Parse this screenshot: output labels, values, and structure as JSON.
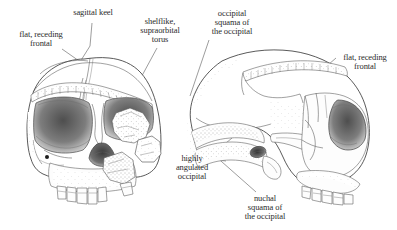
{
  "figure": {
    "background_color": "#ffffff",
    "ink_color": "#3c3c3c",
    "leader_color": "#5a5a5a",
    "views": [
      {
        "id": "frontal-skull",
        "name": "frontal view skull",
        "description": "Anterior (front) view of a Homo erectus cranium showing orbits, nasal aperture, supraorbital torus and maxillary teeth"
      },
      {
        "id": "lateral-skull",
        "name": "lateral view skull",
        "description": "Right lateral (profile) view of a Homo erectus cranium facing right, showing occipital region, supraorbital torus and facial skeleton"
      }
    ]
  },
  "labels": [
    {
      "id": "flat-receding-frontal-left",
      "text": "flat, receding\nfrontal",
      "lines": [
        "flat, receding",
        "frontal"
      ],
      "target_view": "frontal-skull"
    },
    {
      "id": "sagittal-keel",
      "text": "sagittal keel",
      "lines": [
        "sagittal keel"
      ],
      "target_view": "frontal-skull"
    },
    {
      "id": "shelflike-supraorbital-torus",
      "text": "shelflike,\nsupraorbital\ntorus",
      "lines": [
        "shelflike,",
        "supraorbital",
        "torus"
      ],
      "target_view": "frontal-skull"
    },
    {
      "id": "occipital-squama",
      "text": "occipital\nsquama of\nthe occipital",
      "lines": [
        "occipital",
        "squama of",
        "the occipital"
      ],
      "target_view": "lateral-skull"
    },
    {
      "id": "flat-receding-frontal-right",
      "text": "flat, receding\nfrontal",
      "lines": [
        "flat, receding",
        "frontal"
      ],
      "target_view": "lateral-skull"
    },
    {
      "id": "highly-angulated-occipital",
      "text": "highly\nangulated\noccipital",
      "lines": [
        "highly",
        "angulated",
        "occipital"
      ],
      "target_view": "lateral-skull"
    },
    {
      "id": "nuchal-squama",
      "text": "nuchal\nsquama of\nthe occipital",
      "lines": [
        "nuchal",
        "squama of",
        "the occipital"
      ],
      "target_view": "lateral-skull"
    }
  ]
}
